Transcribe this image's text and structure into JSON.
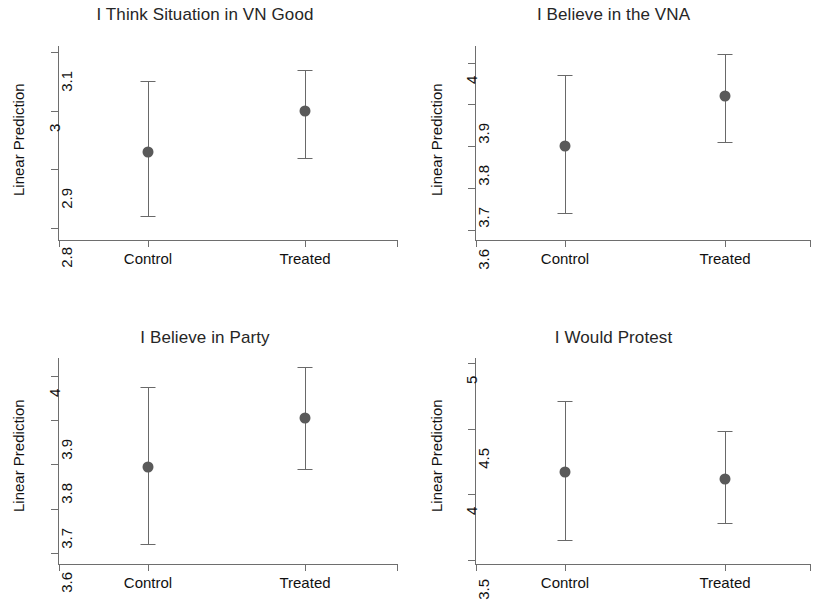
{
  "figure": {
    "ylabel": "Linear Prediction",
    "group_labels": [
      "Control",
      "Treated"
    ],
    "marker_color": "#5a5a5a",
    "line_color": "#696969",
    "axis_color": "#6e6e6e",
    "title_color": "#262626"
  },
  "chart_data": [
    {
      "type": "scatter",
      "title": "I Think Situation in VN Good",
      "xlabel": "",
      "ylabel": "Linear Prediction",
      "categories": [
        "Control",
        "Treated"
      ],
      "values": [
        2.93,
        3.0
      ],
      "ci_low": [
        2.82,
        2.92
      ],
      "ci_high": [
        3.05,
        3.07
      ],
      "yticks": [
        "2.8",
        "2.9",
        "3",
        "3.1"
      ],
      "ytick_values": [
        2.8,
        2.9,
        3.0,
        3.1
      ],
      "ylim": [
        2.78,
        3.11
      ],
      "grid": false,
      "legend": "none",
      "error_bars": "95% confidence interval"
    },
    {
      "type": "scatter",
      "title": "I Believe in the VNA",
      "xlabel": "",
      "ylabel": "Linear Prediction",
      "categories": [
        "Control",
        "Treated"
      ],
      "values": [
        3.8,
        3.92
      ],
      "ci_low": [
        3.64,
        3.81
      ],
      "ci_high": [
        3.97,
        4.02
      ],
      "yticks": [
        "3.6",
        "3.7",
        "3.8",
        "3.9",
        "4"
      ],
      "ytick_values": [
        3.6,
        3.7,
        3.8,
        3.9,
        4.0
      ],
      "ylim": [
        3.575,
        4.04
      ],
      "grid": false,
      "legend": "none",
      "error_bars": "95% confidence interval"
    },
    {
      "type": "scatter",
      "title": "I Believe in Party",
      "xlabel": "",
      "ylabel": "Linear Prediction",
      "categories": [
        "Control",
        "Treated"
      ],
      "values": [
        3.795,
        3.905
      ],
      "ci_low": [
        3.62,
        3.79
      ],
      "ci_high": [
        3.975,
        4.02
      ],
      "yticks": [
        "3.6",
        "3.7",
        "3.8",
        "3.9",
        "4"
      ],
      "ytick_values": [
        3.6,
        3.7,
        3.8,
        3.9,
        4.0
      ],
      "ylim": [
        3.575,
        4.04
      ],
      "grid": false,
      "legend": "none",
      "error_bars": "95% confidence interval"
    },
    {
      "type": "scatter",
      "title": "I Would Protest",
      "xlabel": "",
      "ylabel": "Linear Prediction",
      "categories": [
        "Control",
        "Treated"
      ],
      "values": [
        4.17,
        4.12
      ],
      "ci_low": [
        3.65,
        3.78
      ],
      "ci_high": [
        4.71,
        4.48
      ],
      "yticks": [
        "3.5",
        "4",
        "4.5",
        "5"
      ],
      "ytick_values": [
        3.5,
        4.0,
        4.5,
        5.0
      ],
      "ylim": [
        3.47,
        5.04
      ],
      "grid": false,
      "legend": "none",
      "error_bars": "95% confidence interval"
    }
  ]
}
